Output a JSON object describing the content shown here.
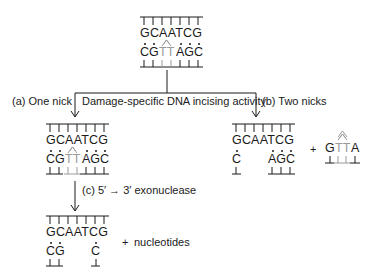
{
  "diagram": {
    "top_duplex": {
      "top_strand": "GCAATCG",
      "bottom_strand_left": "CG",
      "bottom_strand_dimer": "TT",
      "bottom_strand_right": "AGC",
      "damage_mark": "thymine dimer"
    },
    "branch_label": "Damage-specific DNA incising activity",
    "path_a": {
      "label": "(a) One nick",
      "top_strand": "GCAATCG",
      "bottom_strand_left": "CG",
      "bottom_strand_dimer": "TT",
      "bottom_strand_right": "AGC"
    },
    "path_b": {
      "label": "(b) Two nicks",
      "top_strand": "GCAATCG",
      "bottom_strand_left": "C",
      "bottom_strand_right": "AGC",
      "plus": "+",
      "excised_fragment": {
        "left": "G",
        "dimer": "TT",
        "right": "A"
      }
    },
    "path_c": {
      "label": "(c) 5′ → 3′ exonuclease",
      "top_strand": "GCAATCG",
      "bottom_strand_left": "CG",
      "bottom_strand_right": "C",
      "plus": "+",
      "product": "nucleotides"
    },
    "colors": {
      "ink": "#1a1a1a",
      "dimer_grey": "#9a9a9a"
    }
  }
}
